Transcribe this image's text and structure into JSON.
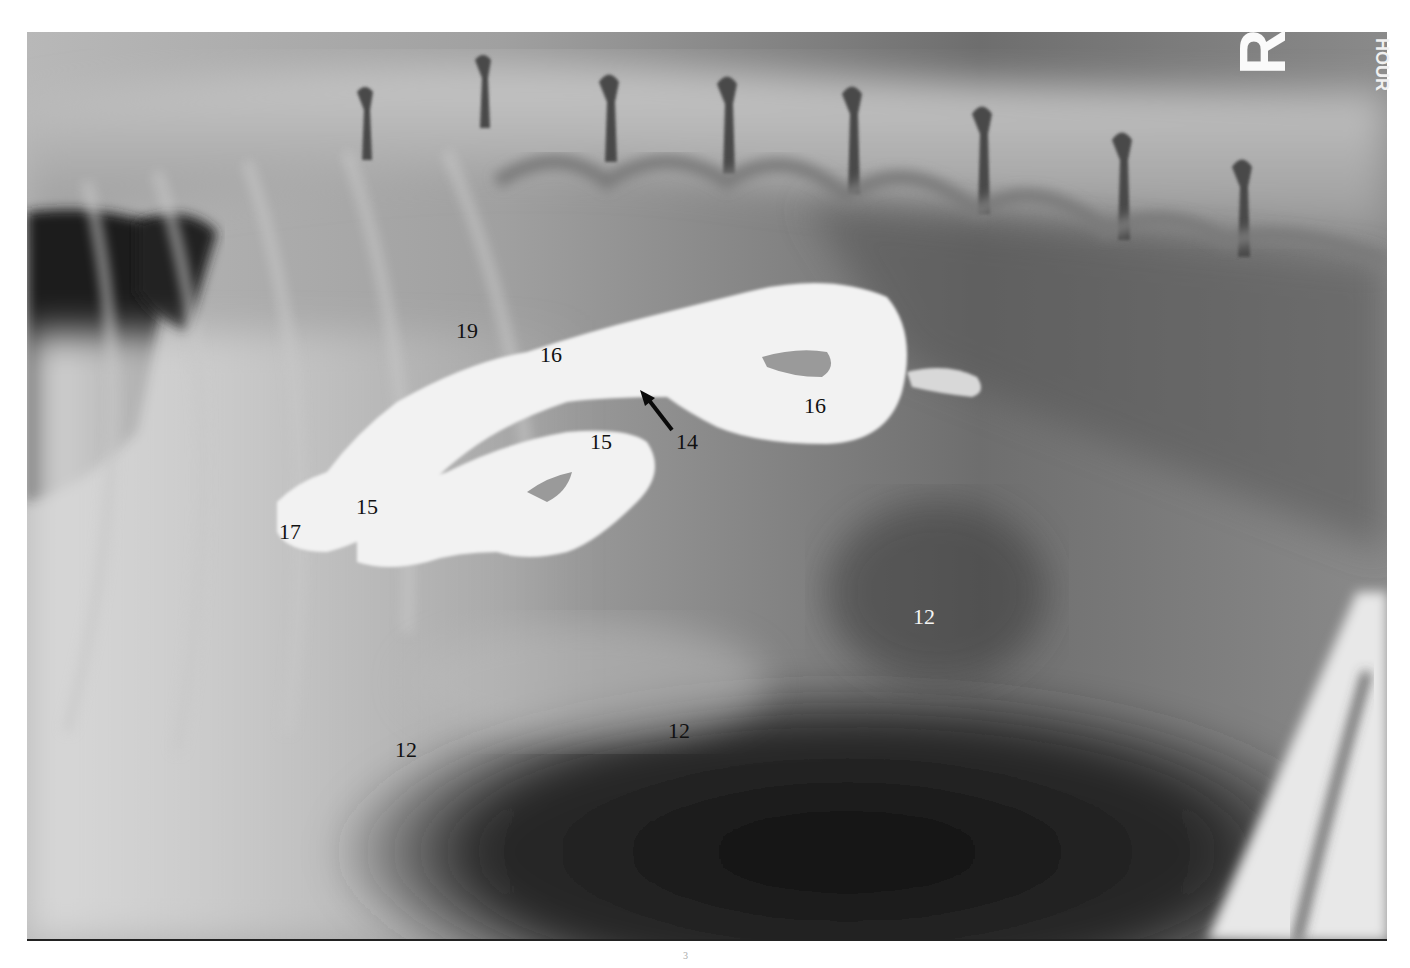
{
  "image": {
    "type": "lateral abdominal radiograph with contrast",
    "side_marker": "R",
    "edge_text": "HOUR",
    "colors": {
      "background": "#ffffff",
      "film_mid": "#8a8a8a",
      "contrast_fill": "#f2f2f2",
      "dark_gas": "#1a1a1a",
      "label_text": "#111111",
      "label_text_light": "#f4f4f4"
    }
  },
  "labels": [
    {
      "id": "19",
      "text": "19",
      "x": 467,
      "y": 331,
      "color": "dark"
    },
    {
      "id": "16a",
      "text": "16",
      "x": 551,
      "y": 355,
      "color": "dark"
    },
    {
      "id": "16b",
      "text": "16",
      "x": 815,
      "y": 406,
      "color": "dark"
    },
    {
      "id": "14",
      "text": "14",
      "x": 687,
      "y": 442,
      "color": "dark"
    },
    {
      "id": "15a",
      "text": "15",
      "x": 601,
      "y": 442,
      "color": "dark"
    },
    {
      "id": "15b",
      "text": "15",
      "x": 367,
      "y": 507,
      "color": "dark"
    },
    {
      "id": "17",
      "text": "17",
      "x": 290,
      "y": 532,
      "color": "dark"
    },
    {
      "id": "12a",
      "text": "12",
      "x": 924,
      "y": 617,
      "color": "light"
    },
    {
      "id": "12b",
      "text": "12",
      "x": 679,
      "y": 731,
      "color": "dark"
    },
    {
      "id": "12c",
      "text": "12",
      "x": 406,
      "y": 750,
      "color": "dark"
    }
  ],
  "arrow": {
    "label_ref": "14",
    "from": [
      672,
      430
    ],
    "to": [
      648,
      397
    ]
  },
  "footmark": "3"
}
